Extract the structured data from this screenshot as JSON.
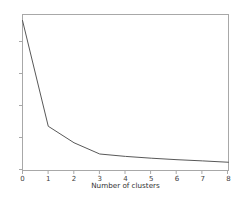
{
  "chart_data": {
    "type": "line",
    "title": "",
    "subtitle": "",
    "xlabel": "Number of clusters",
    "ylabel": "",
    "x": [
      0,
      1,
      2,
      3,
      4,
      5,
      6,
      7,
      8
    ],
    "values": [
      100,
      29.5,
      18.5,
      11.0,
      9.4,
      8.2,
      7.2,
      6.4,
      5.5
    ],
    "series": [
      {
        "name": "inertia",
        "values": [
          100,
          29.5,
          18.5,
          11.0,
          9.4,
          8.2,
          7.2,
          6.4,
          5.5
        ]
      }
    ],
    "xtick_labels": [
      "0",
      "1",
      "2",
      "3",
      "4",
      "5",
      "6",
      "7",
      "8"
    ],
    "ytick_labels": [
      "",
      "",
      "",
      "",
      ""
    ],
    "xlim": [
      0,
      8
    ],
    "ylim": [
      0,
      104
    ],
    "grid": false,
    "legend": false,
    "legend_position": "none",
    "annotations": []
  },
  "style": {
    "figure_background": "#ffffff",
    "axes_background": "#ffffff",
    "line_color": "#585858",
    "spine_color": "#a8a8a8",
    "tick_color": "#a8a8a8",
    "tick_label_color": "#404040",
    "axis_label_color": "#303030"
  },
  "axis_label_text": {
    "x": "Number of clusters"
  }
}
